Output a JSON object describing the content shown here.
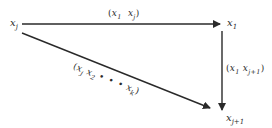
{
  "diagram": {
    "type": "directed-graph",
    "nodes": [
      {
        "id": "xj",
        "base": "x",
        "sub": "j",
        "pos": [
          12,
          19
        ]
      },
      {
        "id": "x1",
        "base": "x",
        "sub": "1",
        "pos": [
          226,
          19
        ]
      },
      {
        "id": "xj1",
        "base": "x",
        "sub": "j+1",
        "pos": [
          226,
          114
        ]
      }
    ],
    "edges": [
      {
        "from": "xj",
        "to": "x1",
        "label": {
          "open": "(",
          "a_base": "x",
          "a_sub": "1",
          "b_base": "x",
          "b_sub": "j",
          "close": ")"
        }
      },
      {
        "from": "x1",
        "to": "xj1",
        "label": {
          "open": "(",
          "a_base": "x",
          "a_sub": "1",
          "b_base": "x",
          "b_sub": "j+1",
          "close": ")"
        }
      },
      {
        "from": "xj",
        "to": "xj1",
        "label": {
          "open": "(",
          "a_base": "x",
          "a_sub": "j",
          "b_base": "x",
          "b_sub": "2",
          "dots": "• • •",
          "c_base": "x",
          "c_sub": "k",
          "close": ")"
        }
      }
    ],
    "colors": {
      "stroke": "#2a2a2a",
      "background": "#ffffff"
    }
  }
}
